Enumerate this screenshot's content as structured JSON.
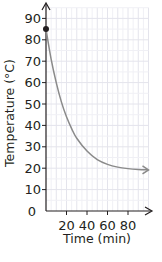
{
  "chart_data": {
    "type": "line",
    "title": "",
    "xlabel": "Time (min)",
    "ylabel": "Temperature (°C)",
    "xlim": [
      0,
      100
    ],
    "ylim": [
      0,
      95
    ],
    "grid": true,
    "legend": null,
    "x_ticks": [
      "20",
      "40",
      "60",
      "80"
    ],
    "y_ticks": [
      "0",
      "10",
      "20",
      "30",
      "40",
      "50",
      "60",
      "70",
      "80",
      "90"
    ],
    "series": [
      {
        "name": "Cooling curve",
        "color": "#8a8a8a",
        "x": [
          0,
          5,
          10,
          15,
          20,
          25,
          30,
          40,
          50,
          60,
          70,
          80,
          90,
          100
        ],
        "values": [
          85,
          71,
          60,
          51,
          44,
          38.5,
          34,
          28,
          24,
          21.8,
          20.5,
          19.8,
          19.4,
          19.2
        ],
        "end_arrow": true
      }
    ],
    "annotations": [
      {
        "type": "point",
        "x": 0,
        "y": 85,
        "color": "#231f20"
      }
    ]
  }
}
